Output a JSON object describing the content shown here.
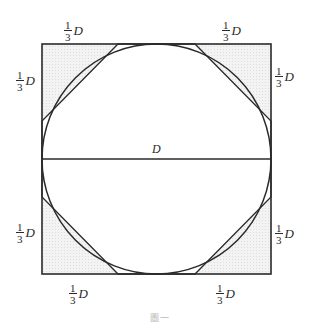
{
  "figure": {
    "caption": "圖一",
    "diameter_label": "D",
    "side_fraction": {
      "numerator": "1",
      "denominator": "3",
      "variable": "D"
    },
    "labels": {
      "top_left": {
        "numerator": "1",
        "denominator": "3",
        "variable": "D"
      },
      "top_right": {
        "numerator": "1",
        "denominator": "3",
        "variable": "D"
      },
      "left_top": {
        "numerator": "1",
        "denominator": "3",
        "variable": "D"
      },
      "right_top": {
        "numerator": "1",
        "denominator": "3",
        "variable": "D"
      },
      "left_bottom": {
        "numerator": "1",
        "denominator": "3",
        "variable": "D"
      },
      "right_bottom": {
        "numerator": "1",
        "denominator": "3",
        "variable": "D"
      },
      "bottom_left": {
        "numerator": "1",
        "denominator": "3",
        "variable": "D"
      },
      "bottom_right": {
        "numerator": "1",
        "denominator": "3",
        "variable": "D"
      }
    },
    "colors": {
      "line": "#2a2a2a",
      "shade": "#efefef",
      "caption": "#b8b8b8"
    }
  }
}
